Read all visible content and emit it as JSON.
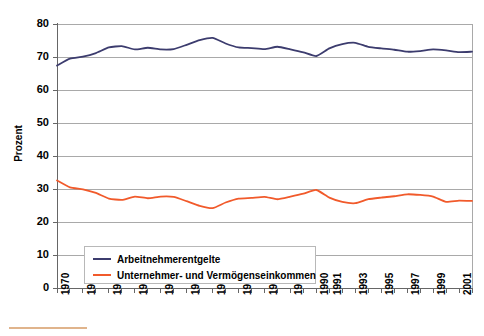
{
  "chart_data": {
    "type": "line",
    "title": "",
    "xlabel": "",
    "ylabel": "Prozent",
    "ylim": [
      0,
      80
    ],
    "ytick_step": 10,
    "yticks": [
      "0",
      "10",
      "20",
      "30",
      "40",
      "50",
      "60",
      "70",
      "80"
    ],
    "grid": true,
    "legend_position": "inside-bottom-left",
    "x": [
      1970,
      1971,
      1972,
      1973,
      1974,
      1975,
      1976,
      1977,
      1978,
      1979,
      1980,
      1981,
      1982,
      1983,
      1984,
      1985,
      1986,
      1987,
      1988,
      1989,
      1990,
      1991,
      1992,
      1993,
      1994,
      1995,
      1996,
      1997,
      1998,
      1999,
      2000,
      2001,
      2002
    ],
    "xtick_labels": [
      "1970",
      "1972",
      "1974",
      "1976",
      "1978",
      "1980",
      "1982",
      "1984",
      "1986",
      "1988",
      "1990",
      "1991",
      "1993",
      "1995",
      "1997",
      "1999",
      "2001"
    ],
    "series": [
      {
        "name": "Arbeitnehmerentgelte",
        "color": "#3c3c6e",
        "values": [
          67.4,
          69.5,
          70.1,
          71.2,
          72.9,
          73.3,
          72.3,
          72.8,
          72.3,
          72.4,
          73.7,
          75.1,
          75.8,
          74.1,
          72.9,
          72.7,
          72.4,
          73.1,
          72.3,
          71.4,
          70.3,
          72.6,
          73.9,
          74.3,
          73.1,
          72.6,
          72.2,
          71.6,
          71.8,
          72.3,
          72.0,
          71.5,
          71.6
        ]
      },
      {
        "name": "Unternehmer- und Vermögenseinkommen",
        "color": "#f15a2b",
        "values": [
          32.6,
          30.5,
          29.9,
          28.8,
          27.1,
          26.7,
          27.7,
          27.2,
          27.7,
          27.6,
          26.3,
          24.9,
          24.2,
          25.9,
          27.1,
          27.3,
          27.6,
          26.9,
          27.7,
          28.6,
          29.7,
          27.4,
          26.1,
          25.7,
          26.9,
          27.4,
          27.8,
          28.4,
          28.2,
          27.7,
          26.1,
          26.5,
          26.4
        ]
      }
    ]
  },
  "axes": {
    "y_title": "Prozent"
  },
  "legend": {
    "entries": [
      {
        "label": "Arbeitnehmerentgelte",
        "color": "#3c3c6e"
      },
      {
        "label": "Unternehmer- und Vermögenseinkommen",
        "color": "#f15a2b"
      }
    ]
  },
  "colors": {
    "series_blue": "#3c3c6e",
    "series_orange": "#f15a2b",
    "grid": "#a9a9a9",
    "axis": "#808080",
    "bottom_rule": "#e0b48c"
  }
}
